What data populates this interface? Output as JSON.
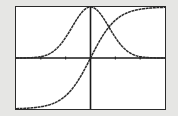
{
  "chart_data": {
    "type": "line",
    "title": "",
    "xlabel": "",
    "ylabel": "",
    "xlim": [
      -3,
      3
    ],
    "ylim": [
      -1,
      1
    ],
    "x_ticks": [
      -2,
      -1,
      1,
      2
    ],
    "grid": false,
    "axes": {
      "x_axis_at_y": 0,
      "y_axis_at_x": 0
    },
    "series": [
      {
        "name": "bell-curve",
        "x": [
          -3,
          -2.5,
          -2,
          -1.5,
          -1,
          -0.5,
          0,
          0.5,
          1,
          1.5,
          2,
          2.5,
          3
        ],
        "values": [
          0.01,
          0.03,
          0.07,
          0.18,
          0.42,
          0.79,
          1.0,
          0.79,
          0.42,
          0.18,
          0.07,
          0.03,
          0.01
        ]
      },
      {
        "name": "s-curve",
        "x": [
          -3,
          -2.5,
          -2,
          -1.5,
          -1,
          -0.5,
          0,
          0.5,
          1,
          1.5,
          2,
          2.5,
          3
        ],
        "values": [
          -1.0,
          -0.99,
          -0.96,
          -0.9,
          -0.76,
          -0.46,
          0.0,
          0.46,
          0.76,
          0.9,
          0.96,
          0.99,
          1.0
        ]
      }
    ],
    "colors": {
      "curve": "#2a2a2a",
      "axes": "#1a1a1a",
      "frame": "#2a2a2a",
      "background": "#ffffff",
      "page": "#e6e6e4"
    }
  }
}
